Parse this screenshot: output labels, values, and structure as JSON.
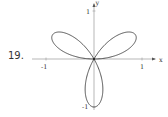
{
  "problem_number": "19.",
  "chart_data": {
    "type": "line",
    "title": "",
    "xlabel": "x",
    "ylabel": "y",
    "x_ticks": [
      "-1",
      "1"
    ],
    "y_ticks": [
      "1",
      "-1"
    ],
    "xlim": [
      -1.2,
      1.3
    ],
    "ylim": [
      -1.1,
      1.2
    ],
    "grid": false,
    "legend": null,
    "series": [
      {
        "name": "r = sin(3θ)",
        "petals_angles_deg": [
          30,
          150,
          270
        ],
        "petal_length": 1
      }
    ]
  },
  "labels": {
    "x_axis": "x",
    "y_axis": "y",
    "x_tick_neg": "-1",
    "x_tick_pos": "1",
    "y_tick_pos": "1",
    "y_tick_neg": "-1"
  }
}
